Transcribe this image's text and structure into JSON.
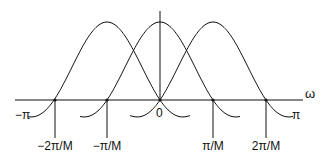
{
  "figure": {
    "axis_label_omega": "ω",
    "label_neg_pi": "−π",
    "label_pi": "π",
    "label_zero": "0",
    "tick_labels": [
      "−2π/M",
      "−π/M",
      "π/M",
      "2π/M"
    ],
    "colors": {
      "stroke": "#111111",
      "background": "#ffffff"
    }
  },
  "chart_data": {
    "type": "line",
    "title": "",
    "xlabel": "ω",
    "ylabel": "",
    "x_ticks": [
      "−2π/M",
      "−π/M",
      "0",
      "π/M",
      "2π/M"
    ],
    "x_range_labels": [
      "−π",
      "π"
    ],
    "series": [
      {
        "name": "lobe centered at −π/M",
        "center": "−π/M",
        "shape": "sinc-like",
        "zeros": [
          "−2π/M",
          "0"
        ]
      },
      {
        "name": "lobe centered at 0",
        "center": "0",
        "shape": "sinc-like",
        "zeros": [
          "−π/M",
          "π/M"
        ]
      },
      {
        "name": "lobe centered at π/M",
        "center": "π/M",
        "shape": "sinc-like",
        "zeros": [
          "0",
          "2π/M"
        ]
      }
    ],
    "grid": false,
    "legend": "none"
  }
}
